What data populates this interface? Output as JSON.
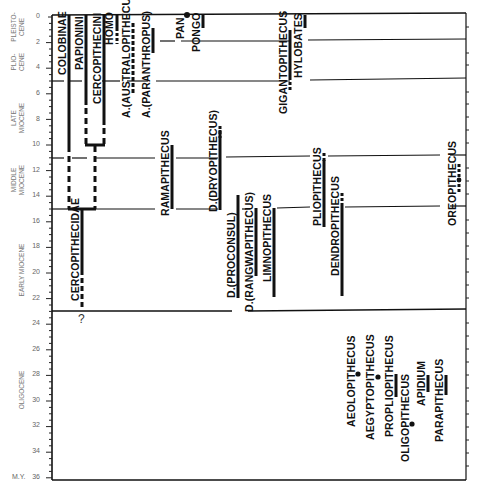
{
  "diagram": {
    "type": "primate phylogeny time chart",
    "axis": {
      "unit_label": "M.Y.",
      "ticks": [
        "0",
        "2",
        "4",
        "6",
        "8",
        "10",
        "12",
        "14",
        "16",
        "18",
        "20",
        "22",
        "24",
        "26",
        "28",
        "30",
        "32",
        "34",
        "36"
      ],
      "min": 0,
      "max": 36
    },
    "epochs": [
      {
        "id": "pleistocene",
        "label_line1": "PLEISTO-",
        "label_line2": "CENE"
      },
      {
        "id": "pliocene",
        "label_line1": "PLIO-",
        "label_line2": "CENE"
      },
      {
        "id": "late-miocene",
        "label_line1": "LATE",
        "label_line2": "MIOCENE"
      },
      {
        "id": "middle-miocene",
        "label_line1": "MIDDLE",
        "label_line2": "MIOCENE"
      },
      {
        "id": "early-miocene",
        "label_line1": "EARLY MIOCENE",
        "label_line2": ""
      },
      {
        "id": "oligocene",
        "label_line1": "OLIGOCENE",
        "label_line2": ""
      }
    ],
    "boundaries_my": [
      1.8,
      5,
      11,
      15,
      23
    ],
    "taxa": {
      "colobinae": "COLOBINAE",
      "papionini": "PAPIONINI",
      "cercopithecini": "CERCOPITHECINI",
      "homo": "HOMO",
      "australopithecus": "A.(AUSTRALOPITHECUS)",
      "paranthropus": "A.(PARANTHROPUS)",
      "pan": "PAN",
      "pongo": "PONGO",
      "gigantopithecus": "GIGANTOPITHECUS",
      "hylobates": "HYLOBATES",
      "cercopithecidae": "CERCOPITHECIDAE",
      "ramapithecus": "RAMAPITHECUS",
      "dryopithecus": "D.(DRYOPITHECUS)",
      "proconsul": "D.(PROCONSUL)",
      "rangwapithecus": "D.(RANGWAPITHECUS)",
      "limnopithecus": "LIMNOPITHECUS",
      "pliopithecus": "PLIOPITHECUS",
      "dendropithecus": "DENDROPITHECUS",
      "oreopithecus": "OREOPITHECUS",
      "aeolopithecus": "AEOLOPITHECUS",
      "aegyptopithecus": "AEGYPTOPITHECUS",
      "propliopithecus": "PROPLIOPITHECUS",
      "oligopithecus": "OLIGOPITHECUS",
      "apidium": "APIDIUM",
      "parapithecus": "PARAPITHECUS"
    },
    "uncertain_marker": "?"
  }
}
